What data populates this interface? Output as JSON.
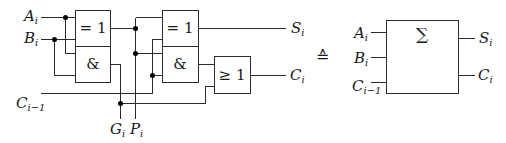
{
  "diagram": {
    "type": "full-adder-logic-circuit",
    "inputs": [
      {
        "name": "A",
        "sub": "i"
      },
      {
        "name": "B",
        "sub": "i"
      },
      {
        "name": "C",
        "sub": "i−1"
      }
    ],
    "outputs": [
      {
        "name": "S",
        "sub": "i"
      },
      {
        "name": "C",
        "sub": "i"
      }
    ],
    "intermediate": [
      {
        "name": "G",
        "sub": "i"
      },
      {
        "name": "P",
        "sub": "i"
      }
    ],
    "gates": {
      "xor1": "= 1",
      "and1": "&",
      "xor2": "= 1",
      "and2": "&",
      "or1": "≥ 1"
    },
    "equivalence_symbol": "≙",
    "block": {
      "symbol": "∑",
      "inputs": [
        {
          "name": "A",
          "sub": "i"
        },
        {
          "name": "B",
          "sub": "i"
        },
        {
          "name": "C",
          "sub": "i−1"
        }
      ],
      "outputs": [
        {
          "name": "S",
          "sub": "i"
        },
        {
          "name": "C",
          "sub": "i"
        }
      ]
    }
  }
}
